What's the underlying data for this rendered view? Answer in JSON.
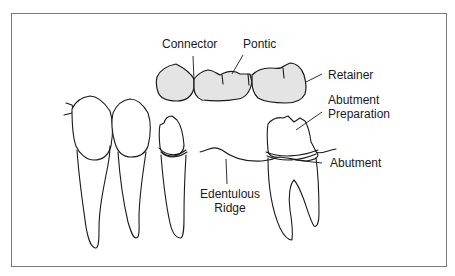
{
  "figure": {
    "frame_color": "#7a7a7a",
    "crown_fill": "#e4e4e4",
    "line_color": "#1a1a1a"
  },
  "labels": {
    "connector": "Connector",
    "pontic": "Pontic",
    "retainer": "Retainer",
    "abutment_preparation_line1": "Abutment",
    "abutment_preparation_line2": "Preparation",
    "abutment": "Abutment",
    "edentulous_ridge_line1": "Edentulous",
    "edentulous_ridge_line2": "Ridge"
  },
  "components": [
    {
      "id": "bridge",
      "parts": [
        "retainer",
        "connector",
        "pontic",
        "connector",
        "retainer"
      ]
    },
    {
      "id": "natural-teeth",
      "count": 3
    },
    {
      "id": "abutment-tooth",
      "state": "prepared"
    },
    {
      "id": "edentulous-ridge"
    }
  ]
}
